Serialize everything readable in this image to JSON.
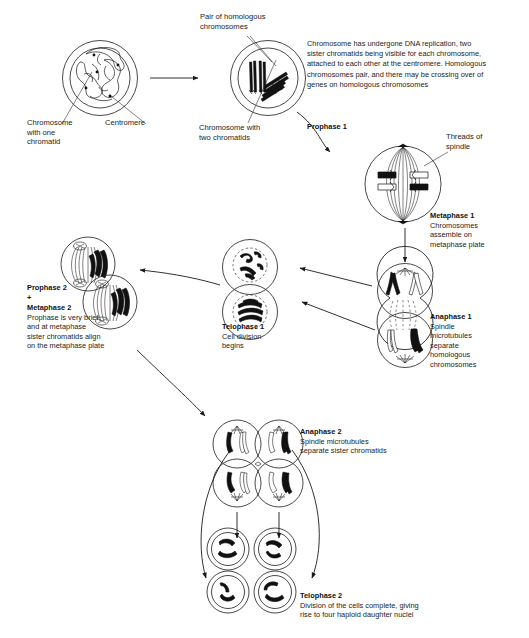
{
  "diagram": {
    "stroke_color": "#1a1a1a",
    "fill_dark": "#111111",
    "background": "#ffffff"
  },
  "labels": {
    "chromosome_one_chromatid": "Chromosome\nwith one\nchromatid",
    "centromere": "Centromere",
    "pair_homologous": "Pair of homologous\nchromosomes",
    "chromosome_two_chromatids": "Chromosome with\ntwo chromatids",
    "threads_of_spindle": "Threads of\nspindle"
  },
  "stages": {
    "prophase1": {
      "heading": "Prophase 1",
      "description": "Chromosome has undergone DNA replication, two\nsister chromatids being visible for each chromosome,\nattached to each other at the centromere. Homologous\nchromosomes pair, and there may be crossing over of\ngenes on homologous chromosomes"
    },
    "metaphase1": {
      "heading": "Metaphase 1",
      "description": "Chromosomes\nassemble on\nmetaphase plate"
    },
    "anaphase1": {
      "heading": "Anaphase 1",
      "description": "Spindle\nmicrotubules\nseparate\nhomologous\nchromosomes"
    },
    "telophase1": {
      "heading": "Telophase 1",
      "description": "Cell division\nbegins"
    },
    "prophase2_metaphase2": {
      "heading_line1": "Prophase 2",
      "heading_plus": "+",
      "heading_line2": "Metaphase 2",
      "description": "Prophase is very brief,\nand at metaphase\nsister chromatids align\non the metaphase plate"
    },
    "anaphase2": {
      "heading": "Anaphase 2",
      "description": "Spindle microtubules\nseparate sister chromatids"
    },
    "telophase2": {
      "heading": "Telophase 2",
      "description": "Division of the cells complete, giving\nrise to four haploid daughter nuclei"
    }
  }
}
